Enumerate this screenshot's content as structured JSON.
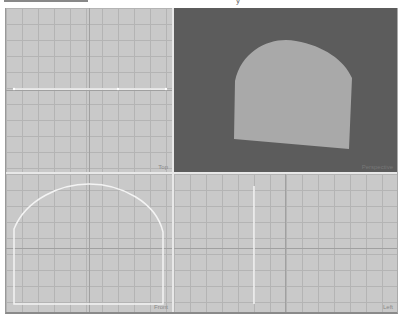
{
  "caption": {
    "glyph": "y"
  },
  "viewports": [
    {
      "id": "top",
      "label": "Top",
      "shape": "profile-line-horizontal"
    },
    {
      "id": "perspective",
      "label": "Perspective",
      "shape": "shaded-arch-extrusion"
    },
    {
      "id": "front",
      "label": "Front",
      "shape": "arch-outline"
    },
    {
      "id": "left",
      "label": "Left",
      "shape": "profile-line-vertical"
    }
  ],
  "colors": {
    "viewport_bg": "#c9c9c9",
    "grid_line": "#b4b4b4",
    "perspective_bg": "#5c5c5c",
    "shape_fill": "#a9a9a9",
    "spline": "#f4f4f4"
  }
}
